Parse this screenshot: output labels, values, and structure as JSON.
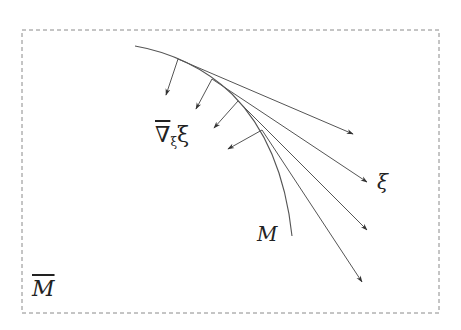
{
  "diagram": {
    "labels": {
      "ambient_manifold": "M",
      "submanifold": "M",
      "vector_field": "ξ",
      "covariant_derivative_nabla": "∇",
      "covariant_derivative_sub": "ξ",
      "covariant_derivative_tail": "ξ"
    },
    "colors": {
      "line": "#555555",
      "frame": "#8a8a8a",
      "text": "#222222",
      "background": "#ffffff"
    },
    "frame": {
      "style": "dashed",
      "x": 22,
      "y": 30,
      "width": 417,
      "height": 283
    },
    "curve_M": {
      "start": [
        135,
        46
      ],
      "end": [
        292,
        236
      ]
    },
    "tangent_arrows": [
      {
        "from": [
          178,
          59
        ],
        "to": [
          353,
          134
        ]
      },
      {
        "from": [
          212,
          79
        ],
        "to": [
          367,
          182
        ]
      },
      {
        "from": [
          238,
          101
        ],
        "to": [
          367,
          230
        ]
      },
      {
        "from": [
          262,
          130
        ],
        "to": [
          362,
          282
        ]
      }
    ],
    "normal_arrows": [
      {
        "from": [
          178,
          59
        ],
        "to": [
          166,
          95
        ]
      },
      {
        "from": [
          212,
          79
        ],
        "to": [
          196,
          109
        ]
      },
      {
        "from": [
          238,
          101
        ],
        "to": [
          214,
          128
        ]
      },
      {
        "from": [
          262,
          130
        ],
        "to": [
          228,
          149
        ]
      }
    ]
  }
}
